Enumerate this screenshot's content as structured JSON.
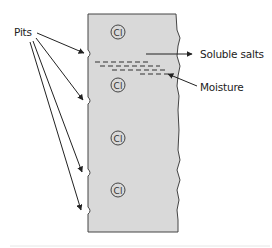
{
  "diagram": {
    "labels": {
      "pits": "Pits",
      "soluble_salts": "Soluble salts",
      "moisture": "Moisture"
    },
    "ions": [
      {
        "symbol": "Cl",
        "charge": "-"
      },
      {
        "symbol": "Cl",
        "charge": "-"
      },
      {
        "symbol": "Cl",
        "charge": "-"
      },
      {
        "symbol": "Cl",
        "charge": "-"
      }
    ],
    "colors": {
      "surface_fill": "#d9d9d9",
      "outline": "#333333",
      "text": "#222222",
      "background": "#ffffff"
    }
  }
}
